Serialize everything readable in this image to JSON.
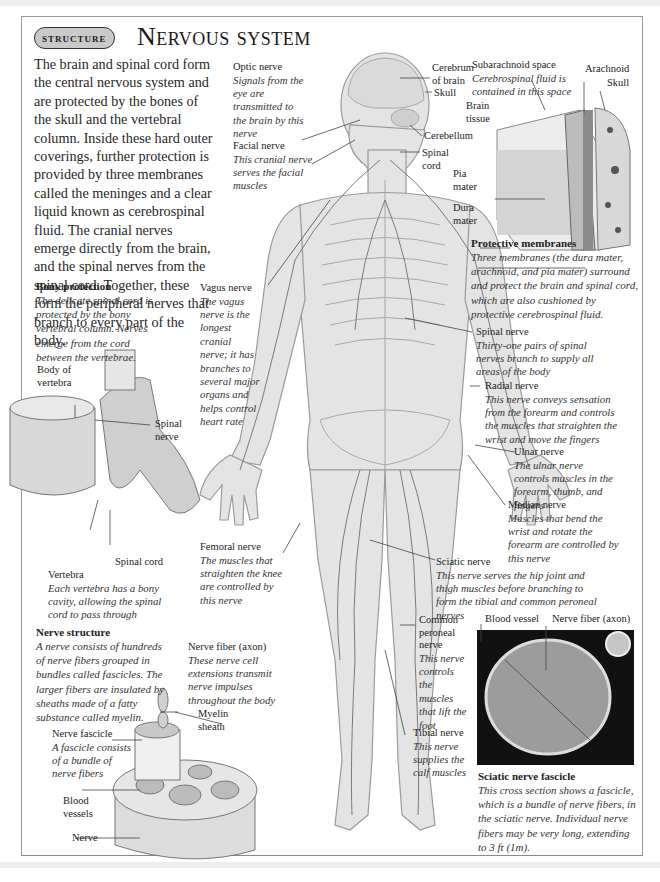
{
  "header": {
    "badge": "Structure",
    "title": "Nervous system"
  },
  "intro": "The brain and spinal cord form the central nervous system and are protected by the bones of the skull and the vertebral column. Inside these hard outer coverings, further protection is provided by three membranes called the meninges and a clear liquid known as cerebrospinal fluid. The cranial nerves emerge directly from the brain, and the spinal nerves from the spinal cord. Together, these form the peripheral nerves that branch to every part of the body.",
  "head_labels": {
    "optic_nerve": {
      "title": "Optic nerve",
      "desc": "Signals from the eye are transmitted to the brain by this nerve"
    },
    "facial_nerve": {
      "title": "Facial nerve",
      "desc": "This cranial nerve serves the facial muscles"
    },
    "cerebrum": "Cerebrum of brain",
    "skull": "Skull",
    "cerebellum": "Cerebellum",
    "spinal_cord": "Spinal cord"
  },
  "meninges": {
    "subarachnoid": {
      "title": "Subarachnoid space",
      "desc": "Cerebrospinal fluid is contained in this space"
    },
    "arachnoid": "Arachnoid",
    "skull": "Skull",
    "brain_tissue": "Brain tissue",
    "pia_mater": "Pia mater",
    "dura_mater": "Dura mater",
    "protective": {
      "title": "Protective membranes",
      "desc": "Three membranes (the dura mater, arachnoid, and pia mater) surround and protect the brain and spinal cord, which are also cushioned by protective cerebrospinal fluid."
    }
  },
  "bony": {
    "title": "Bony protection",
    "desc": "The delicate spinal cord is protected by the bony vertebral column. Nerves emerge from the cord between the vertebrae.",
    "body_of_vertebra": "Body of vertebra",
    "spinal_nerve": "Spinal nerve",
    "spinal_cord": "Spinal cord",
    "vertebra": {
      "title": "Vertebra",
      "desc": "Each vertebra has a bony cavity, allowing the spinal cord to pass through"
    }
  },
  "body_labels": {
    "vagus": {
      "title": "Vagus nerve",
      "desc": "The vagus nerve is the longest cranial nerve; it has branches to several major organs and helps control heart rate"
    },
    "spinal_nerve": {
      "title": "Spinal nerve",
      "desc": "Thirty-one pairs of spinal nerves branch to supply all areas of the body"
    },
    "radial": {
      "title": "Radial nerve",
      "desc": "This nerve conveys sensation from the forearm and controls the muscles that straighten the wrist and move the fingers"
    },
    "ulnar": {
      "title": "Ulnar nerve",
      "desc": "The ulnar nerve controls muscles in the forearm, thumb, and fingers"
    },
    "median": {
      "title": "Median nerve",
      "desc": "Muscles that bend the wrist and rotate the forearm are controlled by this nerve"
    },
    "femoral": {
      "title": "Femoral nerve",
      "desc": "The muscles that straighten the knee are controlled by this nerve"
    },
    "sciatic": {
      "title": "Sciatic nerve",
      "desc": "This nerve serves the hip joint and thigh muscles before branching to form the tibial and common peroneal nerves"
    },
    "peroneal": {
      "title": "Common peroneal nerve",
      "desc": "This nerve controls the muscles that lift the foot"
    },
    "tibial": {
      "title": "Tibial nerve",
      "desc": "This nerve supplies the calf muscles"
    }
  },
  "nerve_structure": {
    "title": "Nerve structure",
    "desc": "A nerve consists of hundreds of nerve fibers grouped in bundles called fascicles. The larger fibers are insulated by sheaths made of a fatty substance called myelin.",
    "fiber": {
      "title": "Nerve fiber (axon)",
      "desc": "These nerve cell extensions transmit nerve impulses throughout the body"
    },
    "myelin": "Myelin sheath",
    "fascicle": {
      "title": "Nerve fascicle",
      "desc": "A fascicle consists of a bundle of nerve fibers"
    },
    "blood_vessels": "Blood vessels",
    "nerve": "Nerve"
  },
  "micrograph": {
    "blood_vessel": "Blood vessel",
    "nerve_fiber": "Nerve fiber (axon)",
    "caption_title": "Sciatic nerve fascicle",
    "caption_desc": "This cross section shows a fascicle, which is a bundle of nerve fibers, in the sciatic nerve. Individual nerve fibers may be very long, extending to 3 ft (1m)."
  },
  "colors": {
    "body_fill": "#e4e4e4",
    "nerve_line": "#7a7a7a",
    "frame": "#9a9a9a",
    "badge_fill": "#c9c9c9"
  }
}
